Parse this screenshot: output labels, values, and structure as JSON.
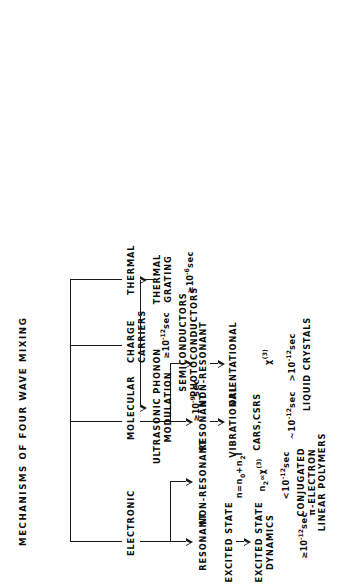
{
  "figure": {
    "title": "MECHANISMS OF FOUR WAVE MIXING",
    "orientation": "rotated-90-ccw"
  },
  "nodes": {
    "electronic": {
      "label": "ELECTRONIC"
    },
    "molecular": {
      "label": "MOLECULAR"
    },
    "charge_carriers": {
      "label": "CHARGE\nCARRIERS",
      "timescale_prefix": "≥10",
      "timescale_exp": "-12",
      "timescale_unit": "sec",
      "materials": "SEMICONDUCTORS\nPHOTOCONDUCTORS"
    },
    "thermal": {
      "label": "THERMAL"
    },
    "electronic_resonant": {
      "label": "RESONANT",
      "child1": "EXCITED STATE",
      "child2": "EXCITED STATE\nDYNAMICS",
      "timescale_prefix": "≥10",
      "timescale_exp": "-12",
      "timescale_unit": "sec"
    },
    "electronic_nonresonant": {
      "label": "NON-RESONANT",
      "formula1_a": "n=n",
      "formula1_sub1": "0",
      "formula1_b": "+n",
      "formula1_sub2": "2",
      "formula1_c": "I",
      "formula2_a": "n",
      "formula2_sub": "2",
      "formula2_b": "∝χ",
      "formula2_sup": "(3)",
      "timescale_prefix": "<10",
      "timescale_exp": "-12",
      "timescale_unit": "sec",
      "materials": "CONJUGATED\nπ-ELECTRON\nLINEAR POLYMERS"
    },
    "molecular_resonant": {
      "label": "RESONANT",
      "child": "VIBRATIONAL",
      "process": "CARS,CSRS",
      "timescale_prefix": "~10",
      "timescale_exp": "-12",
      "timescale_unit": "sec"
    },
    "molecular_nonresonant": {
      "label": "NON-RESONANT",
      "child": "ORIENTATIONAL",
      "formula_a": "χ",
      "formula_sup": "(3)",
      "timescale_prefix": ">10",
      "timescale_exp": "-12",
      "timescale_unit": "sec",
      "materials": "LIQUID CRYSTALS"
    },
    "ultrasonic": {
      "label": "ULTRASONIC PHONON\nMODULATION",
      "timescale_prefix": "≥10",
      "timescale_exp": "-9",
      "timescale_unit": "sec"
    },
    "thermal_grating": {
      "label": "THERMAL\nGRATING",
      "timescale_prefix": "≥10",
      "timescale_exp": "-6",
      "timescale_unit": "sec"
    }
  }
}
